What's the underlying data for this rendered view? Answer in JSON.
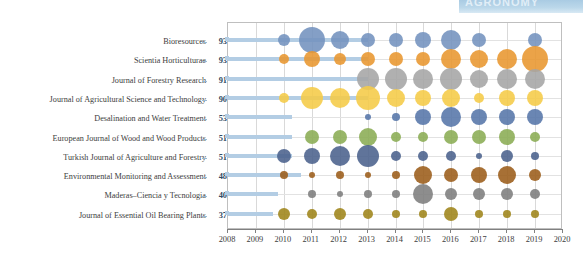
{
  "banner": {
    "text": "AGRONOMY"
  },
  "chart_data": {
    "type": "scatter",
    "title": "",
    "xlabel": "",
    "ylabel": "",
    "legend": "none",
    "grid": true,
    "xlim": [
      2008,
      2020
    ],
    "xticks": [
      2008,
      2009,
      2010,
      2011,
      2012,
      2013,
      2014,
      2015,
      2016,
      2017,
      2018,
      2019,
      2020
    ],
    "categories": [
      "Bioresources",
      "Scientia Horticulturae",
      "Journal of Forestry Research",
      "Journal of Agricultural Science and Technology",
      "Desalination and Water Treatment",
      "European Journal of Wood and Wood Products",
      "Turkish Journal of Agriculture and Forestry",
      "Environmental Monitoring and Assessment",
      "Maderas–Ciencia y Tecnologia",
      "Journal of Essential Oil Bearing Plants"
    ],
    "totals": [
      93,
      93,
      91,
      90,
      53,
      51,
      51,
      48,
      40,
      37
    ],
    "series": [
      {
        "name": "Bioresources",
        "color": "#7392be",
        "bar_end_year": 2013.0,
        "points": [
          {
            "year": 2010,
            "size": 6
          },
          {
            "year": 2011,
            "size": 13
          },
          {
            "year": 2012,
            "size": 9
          },
          {
            "year": 2013,
            "size": 7
          },
          {
            "year": 2014,
            "size": 7
          },
          {
            "year": 2015,
            "size": 8
          },
          {
            "year": 2016,
            "size": 10
          },
          {
            "year": 2017,
            "size": 7
          },
          {
            "year": 2019,
            "size": 7
          }
        ]
      },
      {
        "name": "Scientia Horticulturae",
        "color": "#e8962f",
        "bar_end_year": 2013.0,
        "points": [
          {
            "year": 2010,
            "size": 5
          },
          {
            "year": 2011,
            "size": 8
          },
          {
            "year": 2012,
            "size": 6
          },
          {
            "year": 2013,
            "size": 7
          },
          {
            "year": 2014,
            "size": 7
          },
          {
            "year": 2015,
            "size": 7
          },
          {
            "year": 2016,
            "size": 10
          },
          {
            "year": 2017,
            "size": 9
          },
          {
            "year": 2018,
            "size": 10
          },
          {
            "year": 2019,
            "size": 13
          }
        ]
      },
      {
        "name": "Journal of Forestry Research",
        "color": "#a5a5a5",
        "bar_end_year": 2013.0,
        "points": [
          {
            "year": 2013,
            "size": 11
          },
          {
            "year": 2014,
            "size": 11
          },
          {
            "year": 2015,
            "size": 10
          },
          {
            "year": 2016,
            "size": 11
          },
          {
            "year": 2017,
            "size": 9
          },
          {
            "year": 2018,
            "size": 10
          },
          {
            "year": 2019,
            "size": 10
          }
        ]
      },
      {
        "name": "Journal of Agricultural Science and Technology",
        "color": "#f5cb47",
        "bar_end_year": 2013.0,
        "points": [
          {
            "year": 2010,
            "size": 5
          },
          {
            "year": 2011,
            "size": 11
          },
          {
            "year": 2012,
            "size": 10
          },
          {
            "year": 2013,
            "size": 12
          },
          {
            "year": 2014,
            "size": 9
          },
          {
            "year": 2015,
            "size": 8
          },
          {
            "year": 2016,
            "size": 9
          },
          {
            "year": 2017,
            "size": 5
          },
          {
            "year": 2018,
            "size": 8
          },
          {
            "year": 2019,
            "size": 8
          }
        ]
      },
      {
        "name": "Desalination and Water Treatment",
        "color": "#5575a8",
        "bar_end_year": 2010.3,
        "points": [
          {
            "year": 2013,
            "size": 3
          },
          {
            "year": 2014,
            "size": 4
          },
          {
            "year": 2015,
            "size": 8
          },
          {
            "year": 2016,
            "size": 10
          },
          {
            "year": 2017,
            "size": 8
          },
          {
            "year": 2018,
            "size": 8
          },
          {
            "year": 2019,
            "size": 8
          }
        ]
      },
      {
        "name": "European Journal of Wood and Wood Products",
        "color": "#8aac53",
        "bar_end_year": 2010.3,
        "points": [
          {
            "year": 2011,
            "size": 7
          },
          {
            "year": 2012,
            "size": 7
          },
          {
            "year": 2013,
            "size": 9
          },
          {
            "year": 2014,
            "size": 5
          },
          {
            "year": 2015,
            "size": 5
          },
          {
            "year": 2016,
            "size": 7
          },
          {
            "year": 2017,
            "size": 7
          },
          {
            "year": 2018,
            "size": 8
          },
          {
            "year": 2019,
            "size": 5
          }
        ]
      },
      {
        "name": "Turkish Journal of Agriculture and Forestry",
        "color": "#4a618c",
        "bar_end_year": 2010.3,
        "points": [
          {
            "year": 2010,
            "size": 7
          },
          {
            "year": 2011,
            "size": 8
          },
          {
            "year": 2012,
            "size": 10
          },
          {
            "year": 2013,
            "size": 11
          },
          {
            "year": 2014,
            "size": 5
          },
          {
            "year": 2015,
            "size": 5
          },
          {
            "year": 2016,
            "size": 5
          },
          {
            "year": 2017,
            "size": 3
          },
          {
            "year": 2018,
            "size": 6
          },
          {
            "year": 2019,
            "size": 4
          }
        ]
      },
      {
        "name": "Environmental Monitoring and Assessment",
        "color": "#9b5c19",
        "bar_end_year": 2010.6,
        "points": [
          {
            "year": 2010,
            "size": 4
          },
          {
            "year": 2011,
            "size": 3
          },
          {
            "year": 2012,
            "size": 4
          },
          {
            "year": 2013,
            "size": 3
          },
          {
            "year": 2014,
            "size": 4
          },
          {
            "year": 2015,
            "size": 9
          },
          {
            "year": 2016,
            "size": 7
          },
          {
            "year": 2017,
            "size": 8
          },
          {
            "year": 2018,
            "size": 9
          },
          {
            "year": 2019,
            "size": 6
          }
        ]
      },
      {
        "name": "Maderas–Ciencia y Tecnologia",
        "color": "#7d7d7d",
        "bar_end_year": 2009.8,
        "points": [
          {
            "year": 2011,
            "size": 4
          },
          {
            "year": 2012,
            "size": 3
          },
          {
            "year": 2013,
            "size": 4
          },
          {
            "year": 2014,
            "size": 4
          },
          {
            "year": 2015,
            "size": 10
          },
          {
            "year": 2016,
            "size": 6
          },
          {
            "year": 2017,
            "size": 6
          },
          {
            "year": 2018,
            "size": 6
          },
          {
            "year": 2019,
            "size": 5
          }
        ]
      },
      {
        "name": "Journal of Essential Oil Bearing Plants",
        "color": "#9e8419",
        "bar_end_year": 2009.6,
        "points": [
          {
            "year": 2010,
            "size": 6
          },
          {
            "year": 2011,
            "size": 5
          },
          {
            "year": 2012,
            "size": 6
          },
          {
            "year": 2013,
            "size": 5
          },
          {
            "year": 2014,
            "size": 4
          },
          {
            "year": 2015,
            "size": 4
          },
          {
            "year": 2016,
            "size": 7
          },
          {
            "year": 2017,
            "size": 4
          },
          {
            "year": 2018,
            "size": 4
          },
          {
            "year": 2019,
            "size": 4
          }
        ]
      }
    ]
  }
}
